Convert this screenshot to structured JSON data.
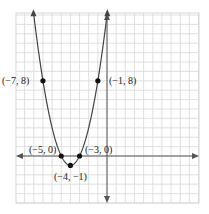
{
  "chart_data": {
    "type": "line",
    "title": "",
    "xlabel": "",
    "ylabel": "",
    "function": "y = (x+4)^2 - 1",
    "grid": true,
    "xlim": [
      -10,
      10
    ],
    "ylim": [
      -5,
      15
    ],
    "points": [
      {
        "x": -7,
        "y": 8,
        "label": "(−7, 8)"
      },
      {
        "x": -1,
        "y": 8,
        "label": "(−1, 8)"
      },
      {
        "x": -5,
        "y": 0,
        "label": "(−5, 0)"
      },
      {
        "x": -3,
        "y": 0,
        "label": "(−3, 0)"
      },
      {
        "x": -4,
        "y": -1,
        "label": "(−4, −1)"
      }
    ]
  },
  "labels": {
    "p1": "(−7, 8)",
    "p2": "(−1, 8)",
    "p3": "(−5, 0)",
    "p4": "(−3, 0)",
    "p5": "(−4, −1)"
  },
  "colors": {
    "grid": "#d8d8d8",
    "axis": "#555555",
    "curve": "#444444",
    "point": "#111111"
  }
}
